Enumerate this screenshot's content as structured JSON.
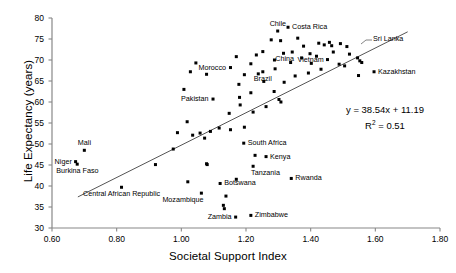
{
  "chart_data": {
    "type": "scatter",
    "title": "",
    "xlabel": "Societal Support Index",
    "ylabel": "Life Expectancy (years)",
    "xlim": [
      0.6,
      1.8
    ],
    "ylim": [
      30,
      80
    ],
    "xticks": [
      0.6,
      0.8,
      1.0,
      1.2,
      1.4,
      1.6,
      1.8
    ],
    "xtick_labels": [
      "0.60",
      "0.80",
      "1.00",
      "1.20",
      "1.40",
      "1.60",
      "1.80"
    ],
    "yticks": [
      30,
      35,
      40,
      45,
      50,
      55,
      60,
      65,
      70,
      75,
      80
    ],
    "ytick_labels": [
      "30",
      "35",
      "40",
      "45",
      "50",
      "55",
      "60",
      "65",
      "70",
      "75",
      "80"
    ],
    "grid": false,
    "legend": null,
    "marker": {
      "shape": "square",
      "color": "#000000",
      "size": 3
    },
    "trendline": {
      "type": "linear",
      "slope": 38.54,
      "intercept": 11.19,
      "r_squared": 0.51,
      "equation_text": "y = 38.54x + 11.19",
      "r2_text_prefix": "R",
      "r2_text_sup": "2",
      "r2_text_suffix": " = 0.51",
      "x_start": 0.68,
      "x_end": 1.7,
      "color": "#555555"
    },
    "points": [
      {
        "x": 0.7,
        "y": 48.5,
        "label": "Mali",
        "label_pos": "above"
      },
      {
        "x": 0.673,
        "y": 45.8,
        "label": "Niger",
        "label_pos": "left"
      },
      {
        "x": 0.678,
        "y": 45.2,
        "label": "Burkina Faso",
        "label_pos": "below"
      },
      {
        "x": 0.815,
        "y": 39.7,
        "label": "Central African Republic",
        "label_pos": "below"
      },
      {
        "x": 0.92,
        "y": 45.1,
        "label": "",
        "label_pos": ""
      },
      {
        "x": 0.975,
        "y": 48.8,
        "label": "",
        "label_pos": ""
      },
      {
        "x": 0.988,
        "y": 52.7,
        "label": "",
        "label_pos": ""
      },
      {
        "x": 1.035,
        "y": 52.1,
        "label": "",
        "label_pos": ""
      },
      {
        "x": 1.02,
        "y": 41.0,
        "label": "",
        "label_pos": ""
      },
      {
        "x": 1.072,
        "y": 51.4,
        "label": "",
        "label_pos": ""
      },
      {
        "x": 1.078,
        "y": 45.3,
        "label": "",
        "label_pos": ""
      },
      {
        "x": 1.08,
        "y": 45.1,
        "label": "",
        "label_pos": ""
      },
      {
        "x": 1.062,
        "y": 38.3,
        "label": "Mozambique",
        "label_pos": "below-left"
      },
      {
        "x": 1.12,
        "y": 40.6,
        "label": "Botswana",
        "label_pos": "right"
      },
      {
        "x": 1.138,
        "y": 37.6,
        "label": "",
        "label_pos": ""
      },
      {
        "x": 1.13,
        "y": 35.4,
        "label": "",
        "label_pos": ""
      },
      {
        "x": 1.133,
        "y": 34.6,
        "label": "",
        "label_pos": ""
      },
      {
        "x": 1.168,
        "y": 32.6,
        "label": "Zambia",
        "label_pos": "left"
      },
      {
        "x": 1.17,
        "y": 41.6,
        "label": "",
        "label_pos": ""
      },
      {
        "x": 1.193,
        "y": 50.2,
        "label": "South Africa",
        "label_pos": "right"
      },
      {
        "x": 1.215,
        "y": 33.0,
        "label": "Zimbabwe",
        "label_pos": "right"
      },
      {
        "x": 1.228,
        "y": 47.3,
        "label": "",
        "label_pos": ""
      },
      {
        "x": 1.262,
        "y": 47.0,
        "label": "Kenya",
        "label_pos": "right"
      },
      {
        "x": 1.222,
        "y": 44.7,
        "label": "Tanzania",
        "label_pos": "below-right"
      },
      {
        "x": 1.34,
        "y": 41.8,
        "label": "Rwanda",
        "label_pos": "right"
      },
      {
        "x": 1.018,
        "y": 55.3,
        "label": "",
        "label_pos": ""
      },
      {
        "x": 1.09,
        "y": 53.0,
        "label": "",
        "label_pos": ""
      },
      {
        "x": 1.058,
        "y": 52.6,
        "label": "",
        "label_pos": ""
      },
      {
        "x": 1.117,
        "y": 53.8,
        "label": "",
        "label_pos": ""
      },
      {
        "x": 1.152,
        "y": 53.4,
        "label": "",
        "label_pos": ""
      },
      {
        "x": 1.195,
        "y": 54.0,
        "label": "",
        "label_pos": ""
      },
      {
        "x": 1.148,
        "y": 57.3,
        "label": "",
        "label_pos": ""
      },
      {
        "x": 1.098,
        "y": 60.7,
        "label": "Pakistan",
        "label_pos": "left"
      },
      {
        "x": 1.18,
        "y": 61.1,
        "label": "",
        "label_pos": ""
      },
      {
        "x": 1.182,
        "y": 59.3,
        "label": "",
        "label_pos": ""
      },
      {
        "x": 1.178,
        "y": 64.2,
        "label": "",
        "label_pos": ""
      },
      {
        "x": 1.152,
        "y": 68.2,
        "label": "Morocco",
        "label_pos": "left"
      },
      {
        "x": 1.215,
        "y": 69.1,
        "label": "",
        "label_pos": ""
      },
      {
        "x": 1.238,
        "y": 66.7,
        "label": "",
        "label_pos": ""
      },
      {
        "x": 1.252,
        "y": 72.0,
        "label": "",
        "label_pos": ""
      },
      {
        "x": 1.278,
        "y": 74.8,
        "label": "",
        "label_pos": ""
      },
      {
        "x": 1.298,
        "y": 76.9,
        "label": "Chile",
        "label_pos": "above"
      },
      {
        "x": 1.33,
        "y": 77.8,
        "label": "Costa Rica",
        "label_pos": "right"
      },
      {
        "x": 1.307,
        "y": 74.6,
        "label": "",
        "label_pos": ""
      },
      {
        "x": 1.252,
        "y": 67.2,
        "label": "Brazil",
        "label_pos": "below"
      },
      {
        "x": 1.288,
        "y": 70.0,
        "label": "",
        "label_pos": ""
      },
      {
        "x": 1.316,
        "y": 71.6,
        "label": "",
        "label_pos": ""
      },
      {
        "x": 1.343,
        "y": 71.9,
        "label": "China",
        "label_pos": "below-left"
      },
      {
        "x": 1.36,
        "y": 75.2,
        "label": "",
        "label_pos": ""
      },
      {
        "x": 1.378,
        "y": 73.3,
        "label": "",
        "label_pos": ""
      },
      {
        "x": 1.372,
        "y": 70.5,
        "label": "",
        "label_pos": ""
      },
      {
        "x": 1.398,
        "y": 71.5,
        "label": "",
        "label_pos": ""
      },
      {
        "x": 1.402,
        "y": 69.2,
        "label": "",
        "label_pos": ""
      },
      {
        "x": 1.425,
        "y": 74.0,
        "label": "Sri Lanka",
        "label_pos": "leader"
      },
      {
        "x": 1.442,
        "y": 73.6,
        "label": "",
        "label_pos": ""
      },
      {
        "x": 1.458,
        "y": 74.2,
        "label": "",
        "label_pos": ""
      },
      {
        "x": 1.465,
        "y": 73.4,
        "label": "",
        "label_pos": ""
      },
      {
        "x": 1.47,
        "y": 71.9,
        "label": "",
        "label_pos": ""
      },
      {
        "x": 1.452,
        "y": 70.1,
        "label": "Vietnam",
        "label_pos": "left"
      },
      {
        "x": 1.492,
        "y": 73.9,
        "label": "",
        "label_pos": ""
      },
      {
        "x": 1.512,
        "y": 73.2,
        "label": "",
        "label_pos": ""
      },
      {
        "x": 1.52,
        "y": 71.4,
        "label": "",
        "label_pos": ""
      },
      {
        "x": 1.545,
        "y": 70.5,
        "label": "",
        "label_pos": ""
      },
      {
        "x": 1.552,
        "y": 69.8,
        "label": "",
        "label_pos": ""
      },
      {
        "x": 1.558,
        "y": 69.4,
        "label": "",
        "label_pos": ""
      },
      {
        "x": 1.596,
        "y": 67.2,
        "label": "Kazakhstan",
        "label_pos": "right"
      },
      {
        "x": 1.548,
        "y": 66.3,
        "label": "",
        "label_pos": ""
      },
      {
        "x": 1.432,
        "y": 67.8,
        "label": "",
        "label_pos": ""
      },
      {
        "x": 1.393,
        "y": 66.9,
        "label": "",
        "label_pos": ""
      },
      {
        "x": 1.352,
        "y": 66.2,
        "label": "",
        "label_pos": ""
      },
      {
        "x": 1.318,
        "y": 64.7,
        "label": "",
        "label_pos": ""
      },
      {
        "x": 1.287,
        "y": 62.5,
        "label": "",
        "label_pos": ""
      },
      {
        "x": 1.302,
        "y": 60.6,
        "label": "",
        "label_pos": ""
      },
      {
        "x": 1.308,
        "y": 60.0,
        "label": "",
        "label_pos": ""
      },
      {
        "x": 1.262,
        "y": 58.9,
        "label": "",
        "label_pos": ""
      },
      {
        "x": 1.222,
        "y": 57.6,
        "label": "",
        "label_pos": ""
      },
      {
        "x": 1.215,
        "y": 62.2,
        "label": "",
        "label_pos": ""
      },
      {
        "x": 1.255,
        "y": 64.9,
        "label": "",
        "label_pos": ""
      },
      {
        "x": 1.232,
        "y": 71.2,
        "label": "",
        "label_pos": ""
      },
      {
        "x": 1.195,
        "y": 66.5,
        "label": "",
        "label_pos": ""
      },
      {
        "x": 1.17,
        "y": 70.8,
        "label": "",
        "label_pos": ""
      },
      {
        "x": 1.078,
        "y": 66.6,
        "label": "",
        "label_pos": ""
      },
      {
        "x": 1.045,
        "y": 69.3,
        "label": "",
        "label_pos": ""
      },
      {
        "x": 1.028,
        "y": 67.2,
        "label": "",
        "label_pos": ""
      },
      {
        "x": 1.008,
        "y": 63.0,
        "label": "",
        "label_pos": ""
      },
      {
        "x": 1.29,
        "y": 67.9,
        "label": "",
        "label_pos": ""
      },
      {
        "x": 1.338,
        "y": 69.4,
        "label": "",
        "label_pos": ""
      },
      {
        "x": 1.418,
        "y": 70.9,
        "label": "",
        "label_pos": ""
      },
      {
        "x": 1.488,
        "y": 69.0,
        "label": "",
        "label_pos": ""
      },
      {
        "x": 1.505,
        "y": 68.6,
        "label": "",
        "label_pos": ""
      }
    ]
  }
}
